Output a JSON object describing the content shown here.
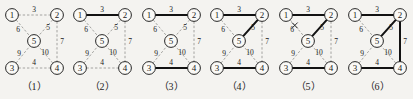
{
  "figure": {
    "panel_count": 6,
    "nodes": [
      {
        "id": "1",
        "label": "1",
        "x": 12,
        "y": 15
      },
      {
        "id": "2",
        "label": "2",
        "x": 57,
        "y": 15
      },
      {
        "id": "5",
        "label": "5",
        "x": 34,
        "y": 41
      },
      {
        "id": "3",
        "label": "3",
        "x": 12,
        "y": 68
      },
      {
        "id": "4",
        "label": "4",
        "x": 57,
        "y": 68
      }
    ],
    "node_radius": 6.4,
    "edges": [
      {
        "id": "e12",
        "from": "1",
        "to": "2",
        "weight": "3",
        "lx": 34,
        "ly": 9
      },
      {
        "id": "e15",
        "from": "1",
        "to": "5",
        "weight": "6",
        "lx": 18,
        "ly": 29
      },
      {
        "id": "e25",
        "from": "2",
        "to": "5",
        "weight": "5",
        "lx": 48,
        "ly": 27
      },
      {
        "id": "e24",
        "from": "2",
        "to": "4",
        "weight": "7",
        "lx": 62,
        "ly": 41
      },
      {
        "id": "e35",
        "from": "3",
        "to": "5",
        "weight": "9",
        "lx": 19,
        "ly": 53
      },
      {
        "id": "e45",
        "from": "4",
        "to": "5",
        "weight": "10",
        "lx": 45,
        "ly": 52
      },
      {
        "id": "e34",
        "from": "3",
        "to": "4",
        "weight": "4",
        "lx": 34,
        "ly": 62
      }
    ],
    "panels": [
      {
        "caption": "（1）",
        "left": 0,
        "selected": [],
        "rejected": []
      },
      {
        "caption": "（2）",
        "left": 68,
        "selected": [
          "e12"
        ],
        "rejected": []
      },
      {
        "caption": "（3）",
        "left": 137,
        "selected": [
          "e12",
          "e34"
        ],
        "rejected": []
      },
      {
        "caption": "（4）",
        "left": 205,
        "selected": [
          "e12",
          "e34",
          "e25"
        ],
        "rejected": []
      },
      {
        "caption": "（5）",
        "left": 274,
        "selected": [
          "e12",
          "e34",
          "e25"
        ],
        "rejected": [
          "e15"
        ]
      },
      {
        "caption": "（6）",
        "left": 343,
        "selected": [
          "e12",
          "e34",
          "e25",
          "e24"
        ],
        "rejected": []
      }
    ],
    "colors": {
      "background": "#f4f3f0",
      "dashed_edge": "#9a9a96",
      "bold_edge": "#121212",
      "node_fill": "#faf9f6",
      "node_stroke": "#1a1a1a",
      "text": "#1a1a1a"
    }
  }
}
